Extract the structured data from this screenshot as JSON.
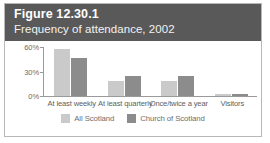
{
  "figure": {
    "number": "Figure 12.30.1",
    "subtitle": "Frequency of attendance, 2002",
    "header_color": "#595959"
  },
  "chart_data": {
    "type": "bar",
    "title": "Frequency of attendance, 2002",
    "xlabel": "",
    "ylabel": "",
    "ylim": [
      0,
      60
    ],
    "yticks": [
      0,
      30,
      60
    ],
    "ytick_labels": [
      "0%",
      "30%",
      "60%"
    ],
    "grid": false,
    "legend_position": "bottom",
    "categories": [
      "At least weekly",
      "At least quarterly",
      "Once/twice a year",
      "Visitors"
    ],
    "series": [
      {
        "name": "All Scotland",
        "color": "#cacaca",
        "values": [
          58,
          18,
          18,
          2
        ]
      },
      {
        "name": "Church of Scotland",
        "color": "#8c8c8c",
        "values": [
          47,
          24,
          24,
          2
        ]
      }
    ]
  }
}
